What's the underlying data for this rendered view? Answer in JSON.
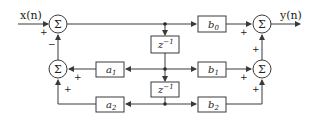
{
  "diagram": {
    "type": "direct-form-II biquad signal flow",
    "input_label": "x(n)",
    "output_label": "y(n)",
    "adder_symbol": "Σ",
    "delay_label": "z",
    "delay_exp": "−1",
    "blocks": {
      "b0": {
        "base": "b",
        "sub": "0"
      },
      "b1": {
        "base": "b",
        "sub": "1"
      },
      "b2": {
        "base": "b",
        "sub": "2"
      },
      "a1": {
        "base": "a",
        "sub": "1"
      },
      "a2": {
        "base": "a",
        "sub": "2"
      }
    },
    "signs": {
      "input_plus": "+",
      "feedback_minus": "−",
      "a1_plus": "+",
      "a2_plus": "+",
      "b0_plus": "+",
      "out_plus": "+",
      "b1_plus": "+",
      "b2_plus": "+"
    }
  }
}
